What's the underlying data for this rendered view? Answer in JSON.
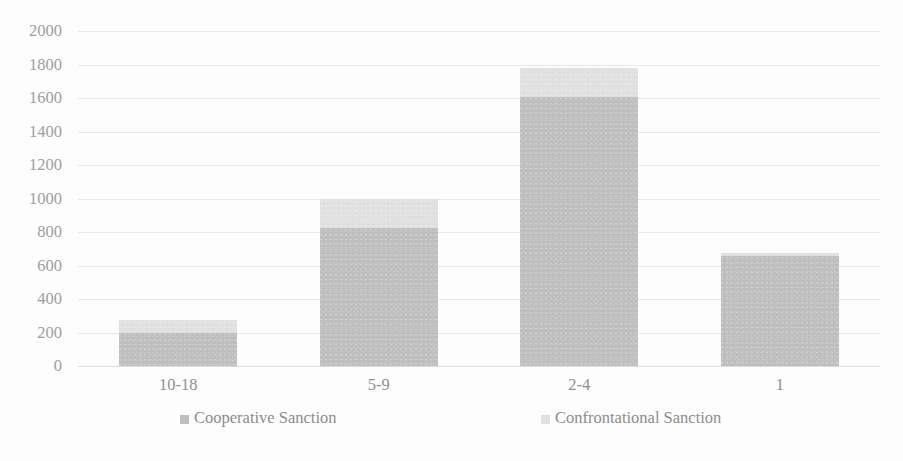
{
  "chart_data": {
    "type": "bar",
    "subtype": "stacked-column",
    "title": "",
    "subtitle": "",
    "xlabel": "",
    "ylabel": "",
    "categories": [
      "10-18",
      "5-9",
      "2-4",
      "1"
    ],
    "series": [
      {
        "name": "Cooperative Sanction",
        "color": "#bfbfbf",
        "values": [
          200,
          825,
          1605,
          655
        ]
      },
      {
        "name": "Confrontational Sanction",
        "color": "#e0e0e0",
        "values": [
          75,
          170,
          175,
          20
        ]
      }
    ],
    "totals": [
      275,
      995,
      1780,
      675
    ],
    "ylim": [
      0,
      2000
    ],
    "ytick_step": 200,
    "yticks": [
      "2000",
      "1800",
      "1600",
      "1400",
      "1200",
      "1000",
      "800",
      "600",
      "400",
      "200",
      "0"
    ],
    "grid": true,
    "grid_color": "#e9e9e9",
    "legend_position": "bottom",
    "axis_text_color": "#969696",
    "background": "#fdfdfd"
  },
  "legend": {
    "items": [
      {
        "label": "Cooperative Sanction",
        "color": "#bfbfbf"
      },
      {
        "label": "Confrontational Sanction",
        "color": "#e0e0e0"
      }
    ]
  }
}
